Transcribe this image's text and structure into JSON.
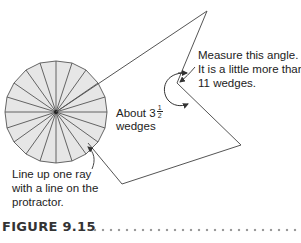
{
  "figure": {
    "caption": "FIGURE 9.15",
    "colors": {
      "protractor_fill": "#e6e6e6",
      "line": "#555555",
      "text": "#222222",
      "caption": "#333333",
      "dots": "#9a9a9a"
    },
    "protractor": {
      "wedge_count": 20,
      "center": [
        56,
        112
      ]
    },
    "labels": {
      "about_wedges_line1_prefix": "About 3",
      "about_wedges_fraction_num": "1",
      "about_wedges_fraction_den": "2",
      "about_wedges_line2": "wedges",
      "measure_line1": "Measure this angle.",
      "measure_line2": "It is a little more than",
      "measure_line3": "11 wedges.",
      "lineup_line1": "Line up one ray",
      "lineup_line2": "with a line on the",
      "lineup_line3": "protractor."
    }
  }
}
